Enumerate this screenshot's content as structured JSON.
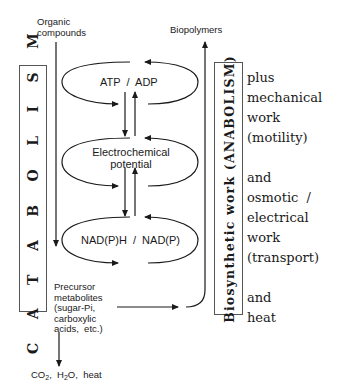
{
  "diagram": {
    "catabolism_label": "C A T A B O L I S M",
    "anabolism_label": "Biosynthetic work (ANABOLISM)",
    "inputs": {
      "organic_compounds": [
        "Organic",
        "compounds"
      ]
    },
    "outputs": {
      "biopolymers": "Biopolymers",
      "waste": {
        "co2": "CO",
        "co2_sub": "2",
        "h2o_pre": "H",
        "h2o_sub": "2",
        "h2o_post": "O,",
        "heat": "heat"
      }
    },
    "cycles": [
      {
        "id": "atp",
        "label": "ATP  /  ADP"
      },
      {
        "id": "electrochemical",
        "label_lines": [
          "Electrochemical",
          "potential"
        ]
      },
      {
        "id": "nadph",
        "label": "NAD(P)H  /  NAD(P)"
      }
    ],
    "precursor": [
      "Precursor",
      "metabolites",
      "(sugar-Pi,",
      "carboxylic",
      "acids,  etc.)"
    ],
    "side_notes": [
      "plus",
      "mechanical",
      "work",
      "(motility)",
      "",
      "and",
      "osmotic  /",
      "electrical",
      "work",
      "(transport)",
      "",
      "and",
      "heat"
    ]
  }
}
